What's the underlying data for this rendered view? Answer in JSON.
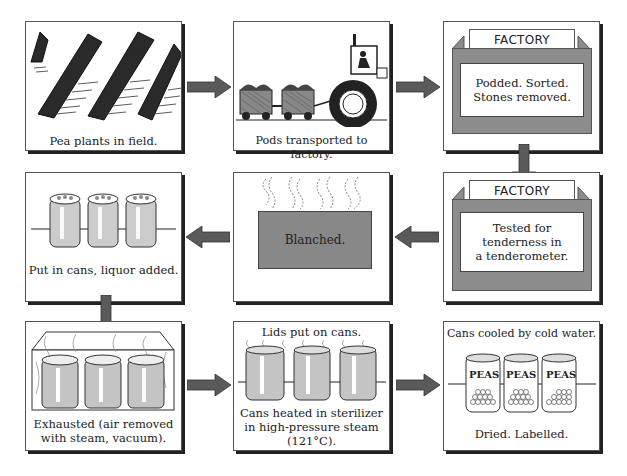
{
  "colors": {
    "arrow": "#5a5a5a",
    "factory_gray": "#8c8c8c",
    "blanch_gray": "#888888",
    "border": "#555555"
  },
  "steps": [
    {
      "id": 1,
      "caption": "Pea plants in field.",
      "image": "pea-plants-illustration"
    },
    {
      "id": 2,
      "caption": "Pods transported to factory.",
      "image": "tractor-with-trailers-illustration"
    },
    {
      "id": 3,
      "header": "FACTORY",
      "text_line1": "Podded. Sorted.",
      "text_line2": "Stones removed."
    },
    {
      "id": 4,
      "header": "FACTORY",
      "text_line1": "Tested for",
      "text_line2": "tenderness in",
      "text_line3": "a tenderometer."
    },
    {
      "id": 5,
      "label": "Blanched.",
      "image": "steaming-tank-illustration"
    },
    {
      "id": 6,
      "caption": "Put in cans, liquor added.",
      "image": "open-cans-illustration"
    },
    {
      "id": 7,
      "caption_line1": "Exhausted (air removed",
      "caption_line2": "with steam, vacuum).",
      "image": "cans-in-steam-chamber-illustration"
    },
    {
      "id": 8,
      "top_caption": "Lids put on cans.",
      "caption_line1": "Cans heated in sterilizer",
      "caption_line2": "in high-pressure steam",
      "caption_line3": "(121°C).",
      "image": "lidded-cans-illustration"
    },
    {
      "id": 9,
      "top_caption": "Cans cooled by cold water.",
      "caption": "Dried. Labelled.",
      "can_label": "PEAS",
      "image": "labelled-pea-cans-illustration"
    }
  ],
  "flow": [
    "1→2 right",
    "2→3 right",
    "3→4 down",
    "4→5 left",
    "5→6 left",
    "6→7 down",
    "7→8 right",
    "8→9 right"
  ]
}
